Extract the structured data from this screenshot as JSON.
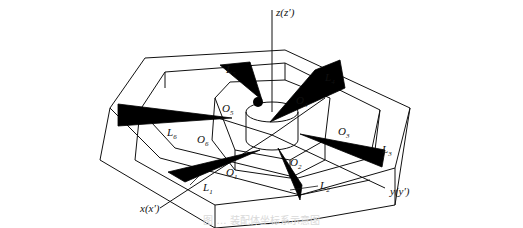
{
  "figure": {
    "type": "isometric-technical-diagram",
    "axes": {
      "z_label": "z(z′)",
      "y_label": "y(y′)",
      "x_label": "x(x′)"
    },
    "points": [
      {
        "id": "O1",
        "base": "O",
        "sub": "1"
      },
      {
        "id": "O2",
        "base": "O",
        "sub": "2"
      },
      {
        "id": "O3",
        "base": "O",
        "sub": "3"
      },
      {
        "id": "O4",
        "base": "O",
        "sub": "4"
      },
      {
        "id": "O5",
        "base": "O",
        "sub": "5"
      },
      {
        "id": "O6",
        "base": "O",
        "sub": "6"
      }
    ],
    "lengths": [
      {
        "id": "L1",
        "base": "L",
        "sub": "1"
      },
      {
        "id": "L2",
        "base": "L",
        "sub": "2"
      },
      {
        "id": "L3",
        "base": "L",
        "sub": "3"
      },
      {
        "id": "L4",
        "base": "L",
        "sub": "4"
      },
      {
        "id": "L5",
        "base": "L",
        "sub": "5"
      },
      {
        "id": "L6",
        "base": "L",
        "sub": "6"
      }
    ],
    "caption": "图 … 装配体坐标系示意图",
    "colors": {
      "ink": "#111111",
      "paper": "#ffffff",
      "show_through": "#e6e6e6"
    }
  }
}
